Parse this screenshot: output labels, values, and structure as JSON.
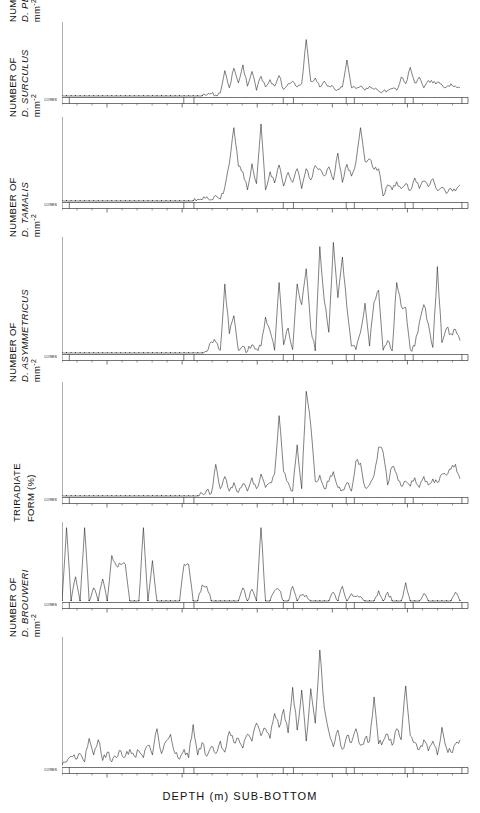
{
  "figure": {
    "xaxis_title": "DEPTH (m) SUB-BOTTOM",
    "core_label": "CORES"
  },
  "chart_data": [
    {
      "type": "line",
      "title": "",
      "panel_index": 0,
      "ylabel_line1": "NUMBER OF",
      "ylabel_line2": "D. PENTARADIATUS",
      "ylabel_units": "mm",
      "ylabel_exponent": "-2",
      "xlabel": "DEPTH (m) SUB-BOTTOM",
      "xlim": [
        32.0,
        58.5
      ],
      "ylim": [
        0,
        4.4
      ],
      "yticks": [
        0,
        2,
        4
      ],
      "ytick_labels": [
        "0",
        "2",
        "4"
      ],
      "xticks": [
        35,
        40,
        45,
        50,
        55
      ],
      "xtick_labels": [
        "35",
        "40",
        "45",
        "50",
        "55"
      ],
      "grid": false,
      "x": [
        32.0,
        32.3,
        32.6,
        32.9,
        33.2,
        33.5,
        33.8,
        34.1,
        34.4,
        34.7,
        35.0,
        35.3,
        35.6,
        35.9,
        36.2,
        36.5,
        36.8,
        37.1,
        37.4,
        37.7,
        38.0,
        38.3,
        38.6,
        38.9,
        39.2,
        39.5,
        39.8,
        40.1,
        40.4,
        40.7,
        41.0,
        41.3,
        41.6,
        41.9,
        42.2,
        42.5,
        42.8,
        43.1,
        43.4,
        43.7,
        44.0,
        44.3,
        44.6,
        44.9,
        45.2,
        45.5,
        45.8,
        46.1,
        46.4,
        46.7,
        47.0,
        47.3,
        47.6,
        47.9,
        48.2,
        48.5,
        48.8,
        49.1,
        49.4,
        49.7,
        50.0,
        50.3,
        50.6,
        50.9,
        51.2,
        51.5,
        51.8,
        52.1,
        52.4,
        52.7,
        53.0,
        53.3,
        53.6,
        53.9,
        54.2,
        54.5,
        54.8,
        55.1,
        55.4,
        55.7,
        56.0,
        56.3,
        56.6,
        56.9,
        57.2,
        57.5,
        57.8,
        58.1,
        58.4
      ],
      "values": [
        0,
        0,
        0,
        0,
        0,
        0,
        0,
        0,
        0,
        0,
        0,
        0,
        0,
        0,
        0,
        0,
        0,
        0,
        0,
        0,
        0,
        0,
        0,
        0,
        0,
        0,
        0,
        0,
        0,
        0,
        0,
        0,
        0.05,
        0.15,
        0.05,
        0.2,
        1.55,
        0.5,
        1.7,
        0.8,
        1.9,
        0.6,
        1.5,
        0.35,
        1.2,
        0.55,
        1.0,
        0.6,
        1.25,
        0.4,
        0.75,
        0.9,
        0.55,
        0.75,
        3.45,
        0.9,
        1.1,
        0.55,
        0.9,
        0.6,
        0.55,
        0.4,
        0.55,
        2.2,
        0.5,
        0.45,
        0.6,
        0.35,
        0.6,
        0.4,
        0.3,
        0.3,
        0.35,
        0.45,
        0.35,
        1.15,
        0.75,
        1.75,
        0.8,
        1.15,
        0.5,
        0.95,
        0.8,
        0.85,
        0.7,
        0.55,
        0.75,
        0.6,
        0.5
      ]
    },
    {
      "type": "line",
      "panel_index": 1,
      "ylabel_line1": "NUMBER OF",
      "ylabel_line2": "D. SURCULUS",
      "ylabel_units": "mm",
      "ylabel_exponent": "-2",
      "xlim": [
        32.0,
        58.5
      ],
      "ylim": [
        0,
        6.6
      ],
      "yticks": [
        0,
        2,
        4,
        6
      ],
      "ytick_labels": [
        "0",
        "2",
        "4",
        "6"
      ],
      "xticks": [
        35,
        40,
        45,
        50,
        55
      ],
      "xtick_labels": [
        "35",
        "40",
        "45",
        "50",
        "55"
      ],
      "grid": false,
      "values": [
        0,
        0,
        0,
        0,
        0,
        0,
        0,
        0,
        0,
        0,
        0,
        0,
        0,
        0,
        0,
        0,
        0,
        0,
        0,
        0,
        0,
        0,
        0,
        0,
        0,
        0,
        0,
        0,
        0,
        0,
        0.15,
        0.1,
        0.35,
        0.1,
        0.45,
        0.15,
        1.1,
        3.0,
        5.9,
        2.8,
        2.35,
        0.9,
        3.0,
        1.4,
        6.2,
        0.9,
        2.35,
        1.45,
        2.9,
        1.2,
        2.3,
        1.5,
        2.6,
        1.0,
        2.6,
        1.7,
        2.85,
        2.6,
        2.0,
        2.75,
        1.7,
        3.85,
        1.5,
        2.95,
        2.0,
        3.15,
        5.9,
        3.2,
        3.4,
        2.55,
        2.6,
        0.4,
        1.3,
        0.9,
        1.55,
        1.0,
        1.4,
        0.85,
        1.85,
        1.0,
        1.6,
        1.15,
        1.8,
        0.85,
        1.1,
        0.6,
        1.0,
        0.8,
        1.3
      ]
    },
    {
      "type": "line",
      "panel_index": 2,
      "ylabel_line1": "NUMBER OF",
      "ylabel_line2": "D. TAMALIS",
      "ylabel_units": "mm",
      "ylabel_exponent": "-2",
      "xlim": [
        32.0,
        58.5
      ],
      "ylim": [
        0,
        16.5
      ],
      "yticks": [
        0,
        5,
        10,
        15
      ],
      "ytick_labels": [
        "0",
        "05",
        "10",
        "15"
      ],
      "xticks": [
        35,
        40,
        45,
        50,
        55
      ],
      "xtick_labels": [
        "35",
        "40",
        "45",
        "50",
        "55"
      ],
      "grid": false,
      "values": [
        0,
        0,
        0,
        0,
        0,
        0,
        0,
        0,
        0,
        0,
        0,
        0,
        0,
        0,
        0,
        0,
        0,
        0,
        0,
        0,
        0,
        0,
        0,
        0,
        0,
        0,
        0,
        0,
        0,
        0,
        0,
        0,
        0.2,
        1.6,
        1.6,
        0.4,
        10.0,
        2.8,
        5.4,
        0.4,
        1.0,
        0.2,
        1.2,
        0.6,
        1.0,
        5.2,
        3.2,
        0.4,
        10.2,
        1.2,
        3.6,
        0.5,
        10.0,
        7.0,
        12.2,
        3.6,
        0.3,
        15.4,
        7.5,
        3.0,
        16.0,
        8.0,
        13.9,
        6.6,
        1.0,
        0.5,
        3.0,
        7.2,
        1.0,
        7.4,
        9.1,
        0.4,
        1.8,
        0.3,
        10.2,
        6.8,
        6.6,
        0.5,
        1.0,
        4.4,
        7.0,
        4.2,
        0.8,
        12.5,
        1.5,
        3.6,
        2.8,
        3.4,
        1.8
      ]
    },
    {
      "type": "line",
      "panel_index": 3,
      "ylabel_line1": "NUMBER OF",
      "ylabel_line2": "D. ASYMMETRICUS",
      "ylabel_units": "mm",
      "ylabel_exponent": "-2",
      "xlim": [
        32.0,
        58.5
      ],
      "ylim": [
        0,
        4.6
      ],
      "yticks": [
        0,
        1,
        2,
        3,
        4
      ],
      "ytick_labels": [
        "0",
        "1",
        "2",
        "3",
        "4"
      ],
      "xticks": [
        35,
        40,
        45,
        50,
        55
      ],
      "xtick_labels": [
        "35",
        "40",
        "45",
        "50",
        "55"
      ],
      "grid": false,
      "values": [
        0,
        0,
        0,
        0,
        0,
        0,
        0,
        0,
        0,
        0,
        0,
        0,
        0,
        0,
        0,
        0,
        0,
        0,
        0,
        0,
        0,
        0,
        0,
        0,
        0,
        0,
        0,
        0,
        0,
        0,
        0,
        0.1,
        0.25,
        0.1,
        1.3,
        0.3,
        0.8,
        0.2,
        0.55,
        0.15,
        0.5,
        0.2,
        0.75,
        0.3,
        0.9,
        0.35,
        0.55,
        0.9,
        3.3,
        1.0,
        0.55,
        0.2,
        2.1,
        0.3,
        4.3,
        2.9,
        0.6,
        0.85,
        0.3,
        0.6,
        1.0,
        0.35,
        0.25,
        0.55,
        0.2,
        1.45,
        1.35,
        0.35,
        0.45,
        0.85,
        2.0,
        1.8,
        0.45,
        1.2,
        0.9,
        0.4,
        0.6,
        0.4,
        0.75,
        0.35,
        0.8,
        0.45,
        0.7,
        0.55,
        0.9,
        0.85,
        1.1,
        1.3,
        0.7
      ]
    },
    {
      "type": "line",
      "panel_index": 4,
      "ylabel_line1": "TRIRADIATE",
      "ylabel_line2": "FORM (%)",
      "ylabel_units": "",
      "ylabel_exponent": "",
      "xlim": [
        32.0,
        58.5
      ],
      "ylim": [
        0,
        105
      ],
      "yticks": [
        0,
        50,
        100
      ],
      "ytick_labels": [
        "0",
        "50",
        "100"
      ],
      "xticks": [
        35,
        40,
        45,
        50,
        55
      ],
      "xtick_labels": [
        "35",
        "40",
        "45",
        "50",
        "55"
      ],
      "grid": false,
      "values": [
        0,
        100,
        0,
        33,
        0,
        100,
        0,
        18,
        0,
        30,
        0,
        62,
        48,
        50,
        50,
        0,
        0,
        0,
        100,
        0,
        55,
        0,
        0,
        0,
        0,
        0,
        0,
        50,
        50,
        0,
        0,
        22,
        20,
        0,
        0,
        0,
        0,
        0,
        0,
        0,
        18,
        0,
        16,
        0,
        100,
        0,
        0,
        14,
        15,
        0,
        0,
        20,
        0,
        8,
        8,
        0,
        0,
        0,
        0,
        0,
        12,
        0,
        20,
        0,
        10,
        6,
        6,
        0,
        0,
        0,
        14,
        0,
        12,
        0,
        0,
        0,
        25,
        0,
        0,
        0,
        10,
        0,
        0,
        0,
        0,
        0,
        0,
        12,
        0
      ]
    },
    {
      "type": "line",
      "panel_index": 5,
      "ylabel_line1": "NUMBER OF",
      "ylabel_line2": "D. BROUWERI",
      "ylabel_units": "mm",
      "ylabel_exponent": "-2",
      "xlim": [
        32.0,
        58.5
      ],
      "ylim": [
        0,
        4.6
      ],
      "yticks": [
        0,
        1,
        2,
        3,
        4
      ],
      "ytick_labels": [
        "0",
        "1",
        "2",
        "3",
        "4"
      ],
      "xticks": [
        35,
        40,
        45,
        50,
        55
      ],
      "xtick_labels": [
        "35",
        "40",
        "45",
        "50",
        "55"
      ],
      "grid": false,
      "values": [
        0.05,
        0.15,
        0.35,
        0.25,
        0.45,
        0.15,
        1.0,
        0.4,
        0.95,
        0.2,
        0.5,
        0.15,
        0.3,
        0.55,
        0.35,
        0.6,
        0.35,
        0.55,
        0.3,
        0.75,
        0.4,
        1.35,
        0.45,
        0.9,
        1.15,
        0.45,
        0.25,
        0.6,
        0.3,
        1.5,
        0.4,
        0.85,
        0.35,
        0.7,
        0.45,
        0.9,
        0.5,
        1.25,
        0.85,
        1.0,
        0.65,
        1.15,
        0.9,
        1.55,
        1.1,
        1.35,
        1.0,
        1.9,
        1.4,
        2.05,
        1.2,
        2.85,
        1.3,
        2.75,
        0.9,
        2.8,
        1.55,
        4.2,
        2.1,
        1.25,
        0.7,
        1.3,
        0.6,
        1.1,
        0.85,
        1.35,
        0.75,
        1.0,
        0.9,
        2.5,
        0.8,
        0.9,
        1.15,
        0.75,
        1.35,
        0.95,
        2.9,
        1.1,
        0.85,
        0.6,
        0.95,
        0.55,
        0.9,
        0.4,
        1.4,
        0.65,
        0.5,
        0.8,
        0.95
      ]
    }
  ]
}
